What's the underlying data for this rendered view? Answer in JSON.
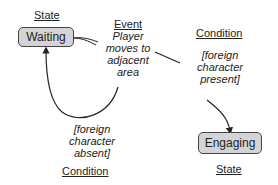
{
  "diagram": {
    "states": [
      {
        "id": "waiting",
        "label": "Waiting",
        "caption": "State"
      },
      {
        "id": "engaging",
        "label": "Engaging",
        "caption": "State"
      }
    ],
    "event": {
      "caption": "Event",
      "text_lines": [
        "Player",
        "moves to",
        "adjacent",
        "area"
      ]
    },
    "conditions": [
      {
        "caption": "Condition",
        "text_lines": [
          "[foreign",
          "character",
          "present]"
        ]
      },
      {
        "caption": "Condition",
        "text_lines": [
          "[foreign",
          "character",
          "absent]"
        ]
      }
    ],
    "colors": {
      "box_fill": "#d4d4d8",
      "box_border": "#444444",
      "line": "#222222"
    }
  }
}
